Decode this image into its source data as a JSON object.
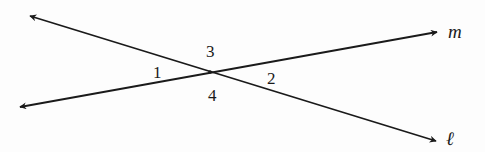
{
  "diagram": {
    "type": "intersecting-lines",
    "stroke_color": "#1a1a1a",
    "intersection": {
      "x": 210,
      "y": 72
    },
    "lines": [
      {
        "name": "l",
        "label": "ℓ",
        "start": {
          "x": 30,
          "y": 16
        },
        "end": {
          "x": 436,
          "y": 141
        },
        "label_pos": {
          "x": 446,
          "y": 145
        }
      },
      {
        "name": "m",
        "label": "m",
        "start": {
          "x": 20,
          "y": 107
        },
        "end": {
          "x": 437,
          "y": 32
        },
        "label_pos": {
          "x": 448,
          "y": 38
        }
      }
    ],
    "angles": [
      {
        "label": "1",
        "x": 153,
        "y": 78
      },
      {
        "label": "2",
        "x": 267,
        "y": 84
      },
      {
        "label": "3",
        "x": 206,
        "y": 57
      },
      {
        "label": "4",
        "x": 208,
        "y": 101
      }
    ]
  }
}
